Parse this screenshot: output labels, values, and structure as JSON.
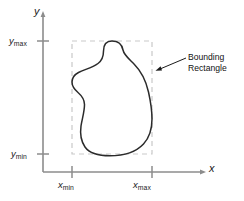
{
  "figure": {
    "type": "diagram",
    "colors": {
      "axis": "#8c8c8c",
      "curve": "#2b2b2b",
      "dashed_rect": "#c9c9c9",
      "text": "#1a1a1a",
      "background": "#ffffff"
    }
  },
  "axes": {
    "y_axis_label": "y",
    "x_axis_label": "x",
    "ticks": {
      "y_max": {
        "letter": "y",
        "sub": "max"
      },
      "y_min": {
        "letter": "y",
        "sub": "min"
      },
      "x_min": {
        "letter": "x",
        "sub": "min"
      },
      "x_max": {
        "letter": "x",
        "sub": "max"
      }
    }
  },
  "annotation": {
    "line1": "Bounding",
    "line2": "Rectangle"
  }
}
